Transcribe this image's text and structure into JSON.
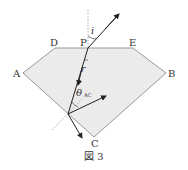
{
  "figure": {
    "caption": "図 3",
    "labels": {
      "A": "A",
      "B": "B",
      "C": "C",
      "D": "D",
      "E": "E",
      "P": "P",
      "incident_angle": "i",
      "refraction_angle": "r",
      "critical_angle": "θ",
      "critical_angle_sub": "AC"
    },
    "colors": {
      "gem_fill": "#ebebeb",
      "edge": "#999999",
      "ray": "#222222",
      "normal": "#aaaaaa"
    }
  }
}
